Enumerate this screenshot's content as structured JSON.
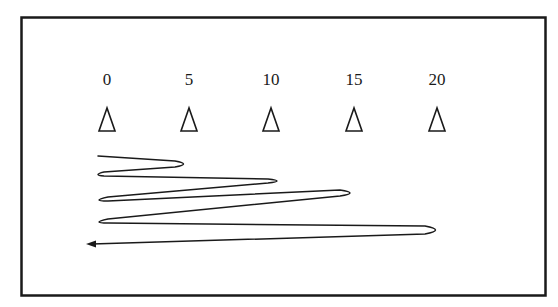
{
  "diagram": {
    "type": "shuttle-run-drill",
    "colors": {
      "stroke": "#1a1a1a",
      "background": "#ffffff"
    },
    "markers": [
      {
        "label": "0",
        "x": 107
      },
      {
        "label": "5",
        "x": 189
      },
      {
        "label": "10",
        "x": 271
      },
      {
        "label": "15",
        "x": 354
      },
      {
        "label": "20",
        "x": 437
      }
    ],
    "marker_icon": "cone-icon",
    "path_description": "Start at 0, run to 5 and back, to 10 and back, to 15 and back, to 20 and back, finishing past start line (arrow)",
    "end_icon": "arrow-left-icon"
  }
}
